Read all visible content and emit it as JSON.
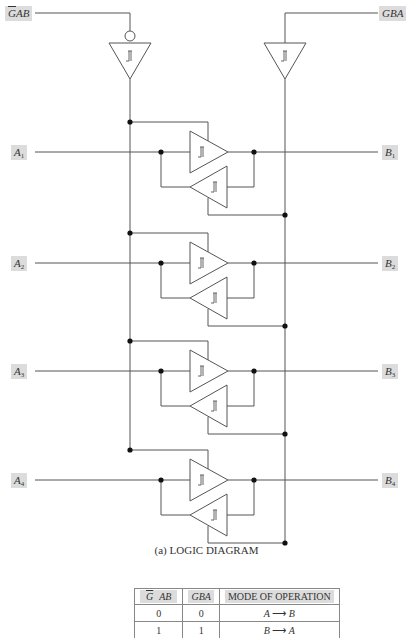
{
  "diagram": {
    "title": "(a) LOGIC DIAGRAM",
    "control_inputs": {
      "gab": {
        "label_bar": "G",
        "label_rest": "AB",
        "label": "GAB (overbar G)"
      },
      "gba": {
        "label": "GBA"
      }
    },
    "ports": [
      {
        "a_base": "A",
        "a_sub": "1",
        "b_base": "B",
        "b_sub": "1"
      },
      {
        "a_base": "A",
        "a_sub": "2",
        "b_base": "B",
        "b_sub": "2"
      },
      {
        "a_base": "A",
        "a_sub": "3",
        "b_base": "B",
        "b_sub": "3"
      },
      {
        "a_base": "A",
        "a_sub": "4",
        "b_base": "B",
        "b_sub": "4"
      }
    ],
    "buffer_symbol": "schmitt-trigger",
    "line_color": "#555555",
    "label_bg": "#dcdcdc"
  },
  "function_table": {
    "headers": [
      {
        "bar": "G",
        "rest": "AB"
      },
      {
        "text": "GBA"
      },
      {
        "text": "MODE OF OPERATION"
      }
    ],
    "rows": [
      {
        "gab": "0",
        "gba": "0",
        "mode_from": "A",
        "mode_arrow": "⟶",
        "mode_to": "B"
      },
      {
        "gab": "1",
        "gba": "1",
        "mode_from": "B",
        "mode_arrow": "⟶",
        "mode_to": "A"
      }
    ]
  }
}
